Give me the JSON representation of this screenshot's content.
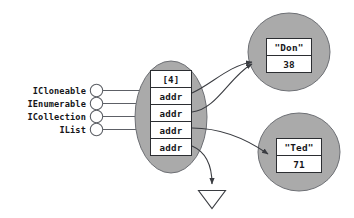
{
  "diagram": {
    "colors": {
      "ellipse_fill": "#aaaaaa",
      "ellipse_stroke": "#6d6f74",
      "cell_fill": "#ffffff",
      "cell_stroke": "#2b2d31",
      "arrow_stroke": "#3a3c41",
      "text": "#15161a",
      "background": "#ffffff"
    },
    "interfaces": [
      {
        "label": "ICloneable"
      },
      {
        "label": "IEnumerable"
      },
      {
        "label": "ICollection"
      },
      {
        "label": "IList"
      }
    ],
    "array_object": {
      "header": "[4]",
      "cells": [
        {
          "value": "addr"
        },
        {
          "value": "addr"
        },
        {
          "value": "addr"
        },
        {
          "value": "addr"
        }
      ]
    },
    "referenced_objects": [
      {
        "name": "\"Don\"",
        "value": "38"
      },
      {
        "name": "\"Ted\"",
        "value": "71"
      }
    ],
    "null_marker": {
      "symbol": "null-triangle"
    },
    "caption": ""
  }
}
